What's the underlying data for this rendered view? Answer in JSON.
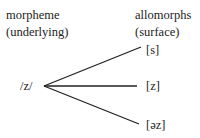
{
  "left_header": {
    "line1": "morpheme",
    "line2": "(underlying)"
  },
  "right_header": {
    "line1": "allomorphs",
    "line2": "(surface)"
  },
  "underlying_form": "/z/",
  "allomorphs": [
    "[s]",
    "[z]",
    "[əz]"
  ]
}
